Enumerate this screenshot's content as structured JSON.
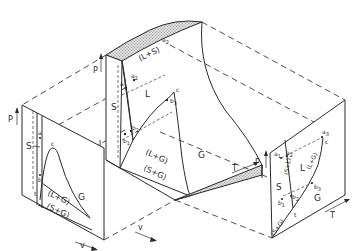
{
  "diagram": {
    "title": "",
    "colors": {
      "line": "#2a2a2a",
      "shade": "#bdbdbd",
      "background": "#ffffff"
    },
    "center_surface": {
      "axis_p": "P",
      "axis_v": "v",
      "axis_t": "T",
      "regions": {
        "liquid_solid": "(L+S)",
        "solid": "S",
        "liquid": "L",
        "liquid_gas": "(L+G)",
        "solid_gas": "(S+G)",
        "gas": "G"
      },
      "points": {
        "a1": "a",
        "a1_sub": "1",
        "a2": "a",
        "a2_sub": "2",
        "a2b": "a",
        "a2b_sub": "2",
        "b1": "b",
        "b1_sub": "1",
        "b2": "b",
        "b2_sub": "2",
        "b3": "b",
        "b3_sub": "3",
        "c": "c"
      }
    },
    "pv_projection": {
      "axis_p": "P",
      "axis_v": "v",
      "regions": {
        "solid": "S",
        "liquid_gas": "(L+G)",
        "solid_gas": "(S+G)",
        "gas": "G"
      },
      "points": {
        "a": "a",
        "b": "b",
        "c": "c",
        "t": "t"
      }
    },
    "pt_projection": {
      "axis_p": "P",
      "axis_t": "T",
      "regions": {
        "solid": "S",
        "liquid": "L",
        "gas": "G",
        "solid_liquid": "(S+L)",
        "liquid_gas": "(L+G)",
        "solid_gas": "(S+G)"
      },
      "points": {
        "a1": "a",
        "a1_sub": "1",
        "a2": "a",
        "a2_sub": "2",
        "a3": "a",
        "a3_sub": "3",
        "b1": "b",
        "b1_sub": "1",
        "b2": "b",
        "b2_sub": "2",
        "b3": "b",
        "b3_sub": "3",
        "c": "c",
        "t": "t"
      }
    }
  }
}
